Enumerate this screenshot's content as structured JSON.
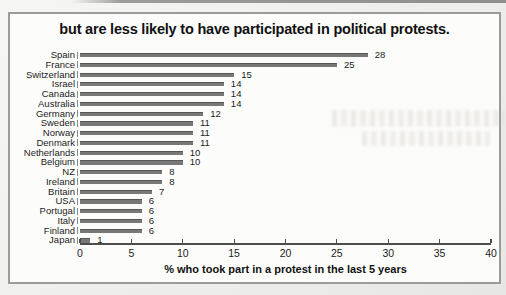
{
  "chart_data": {
    "type": "bar",
    "orientation": "horizontal",
    "title": "but are less likely to have participated in political protests.",
    "xlabel": "% who took part in a protest in the last 5 years",
    "ylabel": "",
    "categories": [
      "Spain",
      "France",
      "Switzerland",
      "Israel",
      "Canada",
      "Australia",
      "Germany",
      "Sweden",
      "Norway",
      "Denmark",
      "Netherlands",
      "Belgium",
      "NZ",
      "Ireland",
      "Britain",
      "USA",
      "Portugal",
      "Italy",
      "Finland",
      "Japan"
    ],
    "values": [
      28,
      25,
      15,
      14,
      14,
      14,
      12,
      11,
      11,
      11,
      10,
      10,
      8,
      8,
      7,
      6,
      6,
      6,
      6,
      1
    ],
    "value_labels": [
      "28",
      "25",
      "15",
      "14",
      "14",
      "14",
      "12",
      "11",
      "11",
      "11",
      "10",
      "10",
      "8",
      "8",
      "7",
      "6",
      "6",
      "6",
      "6",
      "1"
    ],
    "xlim": [
      0,
      40
    ],
    "x_ticks": [
      0,
      5,
      10,
      15,
      20,
      25,
      30,
      35,
      40
    ],
    "grid": false,
    "legend": "none",
    "bar_color": "#787878"
  },
  "colors": {
    "bar": "#787878",
    "axis": "#4d4d4d",
    "frame_border": "#9b9b9b",
    "panel_background": "#fcfcfb",
    "page_background": "#eeeeec",
    "text": "#1c1c1c"
  }
}
